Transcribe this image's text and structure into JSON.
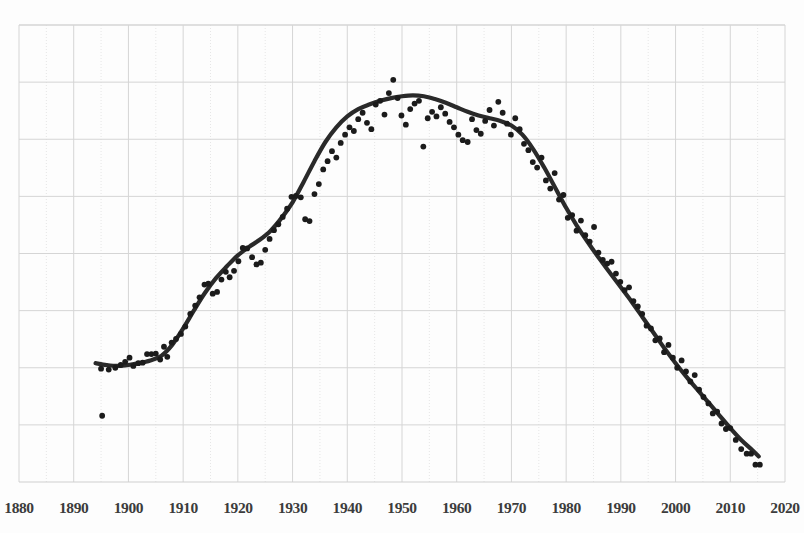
{
  "chart_data": {
    "type": "scatter",
    "title": "",
    "subtitle": "",
    "xlabel": "",
    "ylabel": "",
    "xlim": [
      1880,
      2020
    ],
    "ylim": [
      0,
      100
    ],
    "grid": true,
    "legend": null,
    "xticks": [
      1880,
      1890,
      1900,
      1910,
      1920,
      1930,
      1940,
      1950,
      1960,
      1970,
      1980,
      1990,
      2000,
      2010,
      2020
    ],
    "yticks": [],
    "series": [
      {
        "name": "observations",
        "type": "scatter",
        "marker": "circle",
        "color": "#1b1b1b",
        "points": [
          [
            1895.2,
            14.5
          ],
          [
            1895.0,
            24.8
          ],
          [
            1896.4,
            24.6
          ],
          [
            1897.6,
            25.0
          ],
          [
            1898.6,
            25.6
          ],
          [
            1899.4,
            26.3
          ],
          [
            1900.2,
            27.2
          ],
          [
            1900.9,
            25.4
          ],
          [
            1901.8,
            26.0
          ],
          [
            1902.6,
            26.1
          ],
          [
            1903.4,
            28.0
          ],
          [
            1904.2,
            28.0
          ],
          [
            1905.0,
            28.1
          ],
          [
            1905.8,
            26.8
          ],
          [
            1906.5,
            29.6
          ],
          [
            1907.1,
            27.4
          ],
          [
            1907.9,
            30.5
          ],
          [
            1908.7,
            31.3
          ],
          [
            1909.6,
            32.4
          ],
          [
            1910.4,
            34.0
          ],
          [
            1911.3,
            36.8
          ],
          [
            1912.2,
            38.6
          ],
          [
            1913.0,
            40.4
          ],
          [
            1913.9,
            43.2
          ],
          [
            1914.6,
            43.4
          ],
          [
            1915.4,
            41.2
          ],
          [
            1916.2,
            41.6
          ],
          [
            1917.0,
            44.3
          ],
          [
            1917.8,
            46.0
          ],
          [
            1918.5,
            44.8
          ],
          [
            1919.3,
            46.2
          ],
          [
            1920.1,
            48.3
          ],
          [
            1920.9,
            51.2
          ],
          [
            1921.7,
            51.1
          ],
          [
            1922.6,
            49.2
          ],
          [
            1923.4,
            47.6
          ],
          [
            1924.2,
            48.0
          ],
          [
            1925.0,
            50.8
          ],
          [
            1925.8,
            53.2
          ],
          [
            1926.6,
            55.1
          ],
          [
            1927.4,
            56.4
          ],
          [
            1928.2,
            58.0
          ],
          [
            1929.0,
            59.8
          ],
          [
            1929.8,
            62.4
          ],
          [
            1930.6,
            62.6
          ],
          [
            1931.5,
            62.3
          ],
          [
            1932.3,
            57.5
          ],
          [
            1933.1,
            57.1
          ],
          [
            1934.0,
            63.0
          ],
          [
            1934.8,
            65.2
          ],
          [
            1935.6,
            68.4
          ],
          [
            1936.4,
            70.2
          ],
          [
            1937.2,
            72.4
          ],
          [
            1938.0,
            71.0
          ],
          [
            1938.8,
            74.2
          ],
          [
            1939.6,
            76.0
          ],
          [
            1940.4,
            77.6
          ],
          [
            1941.2,
            76.8
          ],
          [
            1942.0,
            79.4
          ],
          [
            1942.8,
            80.8
          ],
          [
            1943.6,
            78.6
          ],
          [
            1944.4,
            77.2
          ],
          [
            1945.2,
            82.6
          ],
          [
            1946.0,
            83.4
          ],
          [
            1946.8,
            80.4
          ],
          [
            1947.6,
            85.1
          ],
          [
            1948.4,
            88.0
          ],
          [
            1949.2,
            84.0
          ],
          [
            1949.9,
            80.2
          ],
          [
            1950.7,
            78.2
          ],
          [
            1951.5,
            81.6
          ],
          [
            1952.3,
            82.8
          ],
          [
            1953.1,
            83.4
          ],
          [
            1953.9,
            73.4
          ],
          [
            1954.7,
            79.6
          ],
          [
            1955.5,
            81.0
          ],
          [
            1956.3,
            80.0
          ],
          [
            1957.1,
            82.0
          ],
          [
            1957.9,
            80.6
          ],
          [
            1958.7,
            78.8
          ],
          [
            1959.5,
            77.6
          ],
          [
            1960.3,
            76.0
          ],
          [
            1961.1,
            74.8
          ],
          [
            1962.0,
            74.4
          ],
          [
            1962.8,
            79.4
          ],
          [
            1963.6,
            77.0
          ],
          [
            1964.4,
            76.2
          ],
          [
            1965.2,
            79.0
          ],
          [
            1966.0,
            81.4
          ],
          [
            1966.8,
            78.0
          ],
          [
            1967.6,
            83.2
          ],
          [
            1968.4,
            80.8
          ],
          [
            1969.2,
            78.4
          ],
          [
            1969.9,
            76.0
          ],
          [
            1970.7,
            79.6
          ],
          [
            1971.5,
            77.2
          ],
          [
            1972.3,
            74.0
          ],
          [
            1973.1,
            72.6
          ],
          [
            1973.9,
            70.0
          ],
          [
            1974.7,
            68.8
          ],
          [
            1975.5,
            71.0
          ],
          [
            1976.3,
            66.0
          ],
          [
            1977.1,
            64.2
          ],
          [
            1977.9,
            67.6
          ],
          [
            1978.7,
            61.8
          ],
          [
            1979.5,
            62.8
          ],
          [
            1980.3,
            57.8
          ],
          [
            1981.1,
            58.4
          ],
          [
            1981.9,
            55.0
          ],
          [
            1982.7,
            57.2
          ],
          [
            1983.5,
            54.0
          ],
          [
            1984.3,
            52.6
          ],
          [
            1985.1,
            55.8
          ],
          [
            1985.9,
            50.2
          ],
          [
            1986.7,
            48.6
          ],
          [
            1987.5,
            47.8
          ],
          [
            1988.3,
            48.2
          ],
          [
            1989.1,
            45.6
          ],
          [
            1989.9,
            43.8
          ],
          [
            1990.7,
            42.0
          ],
          [
            1991.5,
            42.6
          ],
          [
            1992.3,
            39.6
          ],
          [
            1993.1,
            38.4
          ],
          [
            1993.9,
            36.8
          ],
          [
            1994.7,
            34.2
          ],
          [
            1995.5,
            33.6
          ],
          [
            1996.3,
            31.0
          ],
          [
            1997.1,
            31.4
          ],
          [
            1997.9,
            28.4
          ],
          [
            1998.7,
            30.0
          ],
          [
            1999.5,
            27.2
          ],
          [
            2000.3,
            25.0
          ],
          [
            2001.1,
            26.6
          ],
          [
            2001.9,
            24.2
          ],
          [
            2002.7,
            22.0
          ],
          [
            2003.5,
            23.4
          ],
          [
            2004.3,
            20.2
          ],
          [
            2005.1,
            18.6
          ],
          [
            2006.0,
            17.2
          ],
          [
            2006.8,
            15.0
          ],
          [
            2007.6,
            15.4
          ],
          [
            2008.4,
            12.8
          ],
          [
            2009.2,
            11.6
          ],
          [
            2010.0,
            11.8
          ],
          [
            2011.0,
            9.2
          ],
          [
            2012.0,
            7.2
          ],
          [
            2013.0,
            6.2
          ],
          [
            2013.8,
            6.2
          ],
          [
            2014.6,
            3.8
          ],
          [
            2015.4,
            3.8
          ]
        ]
      },
      {
        "name": "smoothed-trend",
        "type": "line",
        "color": "#2a2a2a",
        "points": [
          [
            1894.0,
            26.0
          ],
          [
            1896.0,
            25.6
          ],
          [
            1898.0,
            25.4
          ],
          [
            1900.0,
            25.6
          ],
          [
            1902.0,
            26.0
          ],
          [
            1904.0,
            26.6
          ],
          [
            1906.0,
            27.6
          ],
          [
            1908.0,
            30.0
          ],
          [
            1910.0,
            33.6
          ],
          [
            1912.0,
            37.6
          ],
          [
            1914.0,
            41.4
          ],
          [
            1916.0,
            44.6
          ],
          [
            1918.0,
            47.2
          ],
          [
            1920.0,
            49.6
          ],
          [
            1922.0,
            51.4
          ],
          [
            1924.0,
            53.0
          ],
          [
            1926.0,
            55.0
          ],
          [
            1928.0,
            57.8
          ],
          [
            1930.0,
            61.2
          ],
          [
            1932.0,
            65.6
          ],
          [
            1934.0,
            70.2
          ],
          [
            1936.0,
            74.4
          ],
          [
            1938.0,
            77.6
          ],
          [
            1940.0,
            80.0
          ],
          [
            1942.0,
            81.6
          ],
          [
            1944.0,
            82.6
          ],
          [
            1946.0,
            83.4
          ],
          [
            1948.0,
            84.0
          ],
          [
            1950.0,
            84.4
          ],
          [
            1952.0,
            84.6
          ],
          [
            1954.0,
            84.4
          ],
          [
            1956.0,
            83.8
          ],
          [
            1958.0,
            83.0
          ],
          [
            1960.0,
            82.0
          ],
          [
            1962.0,
            81.0
          ],
          [
            1964.0,
            80.2
          ],
          [
            1966.0,
            79.6
          ],
          [
            1968.0,
            79.0
          ],
          [
            1970.0,
            78.0
          ],
          [
            1972.0,
            76.0
          ],
          [
            1974.0,
            72.8
          ],
          [
            1976.0,
            68.8
          ],
          [
            1978.0,
            64.4
          ],
          [
            1980.0,
            60.0
          ],
          [
            1982.0,
            56.0
          ],
          [
            1984.0,
            52.4
          ],
          [
            1986.0,
            49.0
          ],
          [
            1988.0,
            45.8
          ],
          [
            1990.0,
            42.6
          ],
          [
            1992.0,
            39.4
          ],
          [
            1994.0,
            36.0
          ],
          [
            1996.0,
            32.6
          ],
          [
            1998.0,
            29.2
          ],
          [
            2000.0,
            26.0
          ],
          [
            2002.0,
            23.0
          ],
          [
            2004.0,
            20.2
          ],
          [
            2006.0,
            17.4
          ],
          [
            2008.0,
            14.6
          ],
          [
            2010.0,
            11.8
          ],
          [
            2012.0,
            9.2
          ],
          [
            2014.0,
            7.0
          ],
          [
            2015.2,
            5.6
          ]
        ]
      }
    ]
  },
  "axis": {
    "x_tick_labels": [
      "1880",
      "1890",
      "1900",
      "1910",
      "1920",
      "1930",
      "1940",
      "1950",
      "1960",
      "1970",
      "1980",
      "1990",
      "2000",
      "2010",
      "2020"
    ]
  },
  "colors": {
    "trend_line": "#2a2a2a",
    "data_point": "#1b1b1b",
    "grid_major": "#d5d5d5",
    "grid_minor": "#e6e6e6",
    "tick_text": "#3c3c3c",
    "background": "#fdfdfd"
  }
}
